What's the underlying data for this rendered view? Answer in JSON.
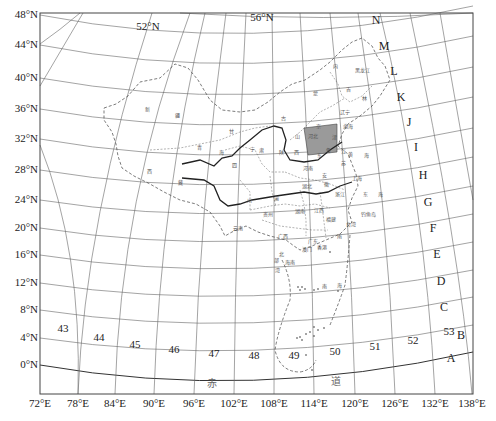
{
  "map": {
    "frame": {
      "left": 40,
      "top": 13,
      "right": 473,
      "bottom": 394
    },
    "latitude_labels": [
      {
        "text": "48°N",
        "y": 18
      },
      {
        "text": "44°N",
        "y": 48
      },
      {
        "text": "40°N",
        "y": 81
      },
      {
        "text": "36°N",
        "y": 112
      },
      {
        "text": "32°N",
        "y": 142
      },
      {
        "text": "28°N",
        "y": 173
      },
      {
        "text": "24°N",
        "y": 203
      },
      {
        "text": "20°N",
        "y": 231
      },
      {
        "text": "16°N",
        "y": 258
      },
      {
        "text": "12°N",
        "y": 286
      },
      {
        "text": "8°N",
        "y": 313
      },
      {
        "text": "4°N",
        "y": 341
      },
      {
        "text": "0°N",
        "y": 368
      }
    ],
    "longitude_labels": [
      {
        "text": "72°E",
        "x": 40
      },
      {
        "text": "78°E",
        "x": 78
      },
      {
        "text": "84°E",
        "x": 115
      },
      {
        "text": "90°E",
        "x": 154
      },
      {
        "text": "96°E",
        "x": 194
      },
      {
        "text": "102°E",
        "x": 234
      },
      {
        "text": "108°E",
        "x": 274
      },
      {
        "text": "114°E",
        "x": 314
      },
      {
        "text": "120°E",
        "x": 355
      },
      {
        "text": "126°E",
        "x": 395
      },
      {
        "text": "132°E",
        "x": 435
      },
      {
        "text": "138°E",
        "x": 472
      }
    ],
    "inner_lat_labels": [
      {
        "text": "52°N",
        "x": 148,
        "y": 30
      },
      {
        "text": "56°N",
        "x": 262,
        "y": 21
      }
    ],
    "row_letters": [
      {
        "text": "N",
        "x": 376,
        "y": 24
      },
      {
        "text": "M",
        "x": 384,
        "y": 50
      },
      {
        "text": "L",
        "x": 394,
        "y": 75
      },
      {
        "text": "K",
        "x": 401,
        "y": 101
      },
      {
        "text": "J",
        "x": 409,
        "y": 126
      },
      {
        "text": "I",
        "x": 416,
        "y": 151
      },
      {
        "text": "H",
        "x": 423,
        "y": 179
      },
      {
        "text": "G",
        "x": 428,
        "y": 206
      },
      {
        "text": "F",
        "x": 433,
        "y": 232
      },
      {
        "text": "E",
        "x": 437,
        "y": 258
      },
      {
        "text": "D",
        "x": 441,
        "y": 285
      },
      {
        "text": "C",
        "x": 444,
        "y": 311
      },
      {
        "text": "B",
        "x": 461,
        "y": 339
      },
      {
        "text": "A",
        "x": 451,
        "y": 362
      }
    ],
    "column_numbers": [
      {
        "text": "43",
        "x": 63,
        "y": 332
      },
      {
        "text": "44",
        "x": 99,
        "y": 341
      },
      {
        "text": "45",
        "x": 135,
        "y": 348
      },
      {
        "text": "46",
        "x": 174,
        "y": 353
      },
      {
        "text": "47",
        "x": 214,
        "y": 357
      },
      {
        "text": "48",
        "x": 254,
        "y": 359
      },
      {
        "text": "49",
        "x": 294,
        "y": 359
      },
      {
        "text": "50",
        "x": 335,
        "y": 355
      },
      {
        "text": "51",
        "x": 375,
        "y": 350
      },
      {
        "text": "52",
        "x": 413,
        "y": 344
      },
      {
        "text": "53",
        "x": 449,
        "y": 335
      }
    ],
    "equator_label": [
      {
        "text": "赤",
        "x": 212,
        "y": 387
      },
      {
        "text": "道",
        "x": 336,
        "y": 385
      }
    ],
    "region_labels": [
      {
        "text": "新",
        "x": 147,
        "y": 111
      },
      {
        "text": "疆",
        "x": 177,
        "y": 117
      },
      {
        "text": "青",
        "x": 199,
        "y": 149
      },
      {
        "text": "海",
        "x": 221,
        "y": 154
      },
      {
        "text": "西",
        "x": 149,
        "y": 173
      },
      {
        "text": "藏",
        "x": 180,
        "y": 184
      },
      {
        "text": "甘",
        "x": 231,
        "y": 133
      },
      {
        "text": "肃",
        "x": 261,
        "y": 152
      },
      {
        "text": "宁",
        "x": 252,
        "y": 151
      },
      {
        "text": "陕",
        "x": 281,
        "y": 154
      },
      {
        "text": "山",
        "x": 297,
        "y": 138
      },
      {
        "text": "西",
        "x": 296,
        "y": 154
      },
      {
        "text": "内",
        "x": 335,
        "y": 68
      },
      {
        "text": "蒙",
        "x": 315,
        "y": 95
      },
      {
        "text": "古",
        "x": 283,
        "y": 120
      },
      {
        "text": "黑龙江",
        "x": 362,
        "y": 72
      },
      {
        "text": "吉",
        "x": 348,
        "y": 91
      },
      {
        "text": "林",
        "x": 364,
        "y": 100
      },
      {
        "text": "辽宁",
        "x": 345,
        "y": 114
      },
      {
        "text": "河北",
        "x": 313,
        "y": 138
      },
      {
        "text": "京",
        "x": 318,
        "y": 128
      },
      {
        "text": "津",
        "x": 334,
        "y": 139
      },
      {
        "text": "鲁",
        "x": 328,
        "y": 152
      },
      {
        "text": "渤海",
        "x": 348,
        "y": 128
      },
      {
        "text": "黄",
        "x": 350,
        "y": 156
      },
      {
        "text": "海",
        "x": 366,
        "y": 157
      },
      {
        "text": "河南",
        "x": 308,
        "y": 170
      },
      {
        "text": "东",
        "x": 319,
        "y": 157
      },
      {
        "text": "苏",
        "x": 343,
        "y": 165
      },
      {
        "text": "江",
        "x": 343,
        "y": 153
      },
      {
        "text": "安",
        "x": 324,
        "y": 177
      },
      {
        "text": "徽",
        "x": 326,
        "y": 186
      },
      {
        "text": "湖北",
        "x": 307,
        "y": 188
      },
      {
        "text": "上海",
        "x": 357,
        "y": 180
      },
      {
        "text": "浙江",
        "x": 340,
        "y": 196
      },
      {
        "text": "东",
        "x": 365,
        "y": 196
      },
      {
        "text": "海",
        "x": 380,
        "y": 196
      },
      {
        "text": "四",
        "x": 234,
        "y": 167
      },
      {
        "text": "川",
        "x": 249,
        "y": 202
      },
      {
        "text": "渝",
        "x": 276,
        "y": 200
      },
      {
        "text": "贵州",
        "x": 268,
        "y": 216
      },
      {
        "text": "湖南",
        "x": 300,
        "y": 213
      },
      {
        "text": "江西",
        "x": 319,
        "y": 212
      },
      {
        "text": "福建",
        "x": 331,
        "y": 221
      },
      {
        "text": "台湾",
        "x": 351,
        "y": 226
      },
      {
        "text": "云南",
        "x": 238,
        "y": 230
      },
      {
        "text": "广西",
        "x": 283,
        "y": 238
      },
      {
        "text": "广东",
        "x": 313,
        "y": 243
      },
      {
        "text": "澳门",
        "x": 307,
        "y": 251
      },
      {
        "text": "香港",
        "x": 322,
        "y": 249
      },
      {
        "text": "南",
        "x": 339,
        "y": 238
      },
      {
        "text": "海南",
        "x": 290,
        "y": 264
      },
      {
        "text": "北",
        "x": 281,
        "y": 256
      },
      {
        "text": "部",
        "x": 276,
        "y": 262
      },
      {
        "text": "湾",
        "x": 277,
        "y": 272
      },
      {
        "text": "南",
        "x": 324,
        "y": 288
      },
      {
        "text": "海",
        "x": 339,
        "y": 287
      },
      {
        "text": "钓鱼岛",
        "x": 368,
        "y": 216
      }
    ],
    "highlight_area": {
      "label": "河北 shaded sheet",
      "color": "#9a9a9a"
    }
  }
}
